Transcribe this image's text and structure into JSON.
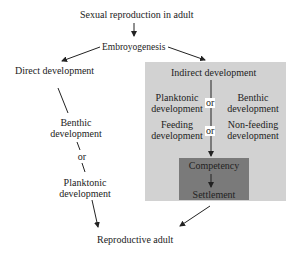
{
  "diagram": {
    "top": "Sexual reproduction in adult",
    "embryo": "Embroyogenesis",
    "direct": {
      "title": "Direct development",
      "option1": [
        "Benthic",
        "development"
      ],
      "or": "or",
      "option2": [
        "Planktonic",
        "development"
      ]
    },
    "indirect": {
      "title": "Indirect development",
      "row1": {
        "left": [
          "Planktonic",
          "development"
        ],
        "or": "or",
        "right": [
          "Benthic",
          "development"
        ]
      },
      "row2": {
        "left": [
          "Feeding",
          "development"
        ],
        "or": "or",
        "right": [
          "Non-feeding",
          "development"
        ]
      },
      "inner": {
        "step1": "Competency",
        "step2": "Settlement"
      }
    },
    "bottom": "Reproductive adult"
  },
  "colors": {
    "panel": "#d2d2d2",
    "inner_box": "#7a7a7a",
    "text": "#222222"
  }
}
